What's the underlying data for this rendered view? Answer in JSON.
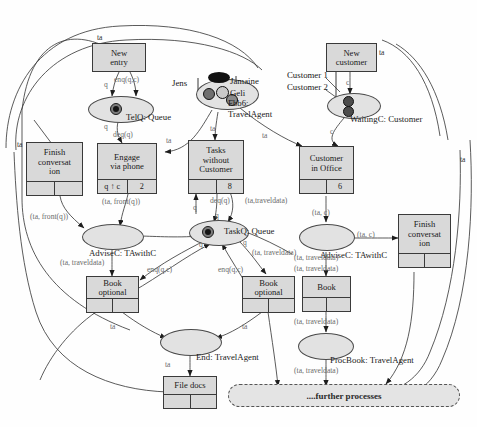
{
  "diagram": {
    "colors": {
      "node_fill": "#d9d9d9",
      "place_fill": "#e2e2e2",
      "stroke": "#3a3a3a",
      "arc_label": "#6a6a6a",
      "further_fill": "#e4e4e4"
    }
  },
  "transitions": [
    {
      "id": "new_entry",
      "label": "New\nentry",
      "cells": null
    },
    {
      "id": "finish_left",
      "label": "Finish\nconversat\nion",
      "cells": [
        "",
        ""
      ]
    },
    {
      "id": "engage_phone",
      "label": "Engage\nvia phone",
      "cells": [
        "q ↑ c",
        "2"
      ]
    },
    {
      "id": "tasks_without",
      "label": "Tasks\nwithout\nCustomer",
      "cells": [
        "",
        "8"
      ]
    },
    {
      "id": "customer_office",
      "label": "Customer\nin Office",
      "cells": [
        "",
        "6"
      ]
    },
    {
      "id": "new_customer",
      "label": "New\ncustomer",
      "cells": null
    },
    {
      "id": "finish_right",
      "label": "Finish\nconversat\nion",
      "cells": [
        "",
        ""
      ]
    },
    {
      "id": "book_optional_l",
      "label": "Book\noptional",
      "cells": [
        "",
        ""
      ]
    },
    {
      "id": "book_optional_r",
      "label": "Book\noptional",
      "cells": [
        "",
        ""
      ]
    },
    {
      "id": "book",
      "label": "Book",
      "cells": [
        "",
        ""
      ]
    },
    {
      "id": "file_docs",
      "label": "File docs",
      "cells": [
        "",
        ""
      ]
    }
  ],
  "places": [
    {
      "id": "telq",
      "label": "TelQ: Queue",
      "tokens": 1
    },
    {
      "id": "travelagent",
      "label": "Fbb6:\nTravelAgent",
      "tokens": 4,
      "extra_labels": [
        "Jens",
        "Jamaine",
        "Geli"
      ]
    },
    {
      "id": "waitingc",
      "label": "WaitingC: Customer",
      "tokens": 2,
      "extra_labels": [
        "Customer 1",
        "Customer 2"
      ]
    },
    {
      "id": "taskq",
      "label": "TaskQ: Queue",
      "tokens": 1
    },
    {
      "id": "advisec_l",
      "label": "AdviseC: TAwithC",
      "tokens": 0
    },
    {
      "id": "advisec_r",
      "label": "AdviseC: TAwithC",
      "tokens": 0
    },
    {
      "id": "end",
      "label": "End: TravelAgent",
      "tokens": 0
    },
    {
      "id": "procbook",
      "label": "ProcBook: TravelAgent",
      "tokens": 0
    }
  ],
  "further_processes": {
    "label": "....further processes"
  },
  "arc_labels": [
    {
      "id": "ta_top",
      "text": "ta"
    },
    {
      "id": "ta_left_outer",
      "text": "ta"
    },
    {
      "id": "ta_right_outer",
      "text": "ta"
    },
    {
      "id": "ta_right_top",
      "text": "ta"
    },
    {
      "id": "enq_newentry",
      "text": "enq(q,c)"
    },
    {
      "id": "q_newentry",
      "text": "q"
    },
    {
      "id": "q_telq_out",
      "text": "q"
    },
    {
      "id": "deq_telq",
      "text": "deq(q)"
    },
    {
      "id": "ta_engage",
      "text": "ta"
    },
    {
      "id": "ta_tasks",
      "text": "ta"
    },
    {
      "id": "ta_customer",
      "text": "ta"
    },
    {
      "id": "c_newcustomer",
      "text": "c"
    },
    {
      "id": "c_waitingc",
      "text": "c"
    },
    {
      "id": "ta_front_q",
      "text": "(ta, front(q))"
    },
    {
      "id": "ta_front_q2",
      "text": "(ta, front(q))"
    },
    {
      "id": "q_tasks",
      "text": "q"
    },
    {
      "id": "deq_tasks",
      "text": "deq(q)"
    },
    {
      "id": "q_taskq_in",
      "text": "q"
    },
    {
      "id": "q_taskq_out",
      "text": "q"
    },
    {
      "id": "q_taskq_right",
      "text": "q"
    },
    {
      "id": "ta_traveldata_top",
      "text": "(ta,traveldata)"
    },
    {
      "id": "ta_c_office",
      "text": "(ta, c)"
    },
    {
      "id": "ta_c_advise",
      "text": "(ta, c)"
    },
    {
      "id": "ta_traveldata_l",
      "text": "(ta, traveldata)"
    },
    {
      "id": "ta_traveldata_r1",
      "text": "(ta, traveldata)"
    },
    {
      "id": "ta_traveldata_r2",
      "text": "(ta, traveldata)"
    },
    {
      "id": "ta_traveldata_r3",
      "text": "(ta, traveldata)"
    },
    {
      "id": "ta_traveldata_r4",
      "text": "(ta, traveldata)"
    },
    {
      "id": "ta_traveldata_q",
      "text": "(ta, traveldata)"
    },
    {
      "id": "enq_left",
      "text": "enq(q,c)"
    },
    {
      "id": "enq_right",
      "text": "enq(q,c)"
    },
    {
      "id": "ta_book_l",
      "text": "ta"
    },
    {
      "id": "ta_book_r",
      "text": "ta"
    },
    {
      "id": "ta_end",
      "text": "ta"
    }
  ]
}
